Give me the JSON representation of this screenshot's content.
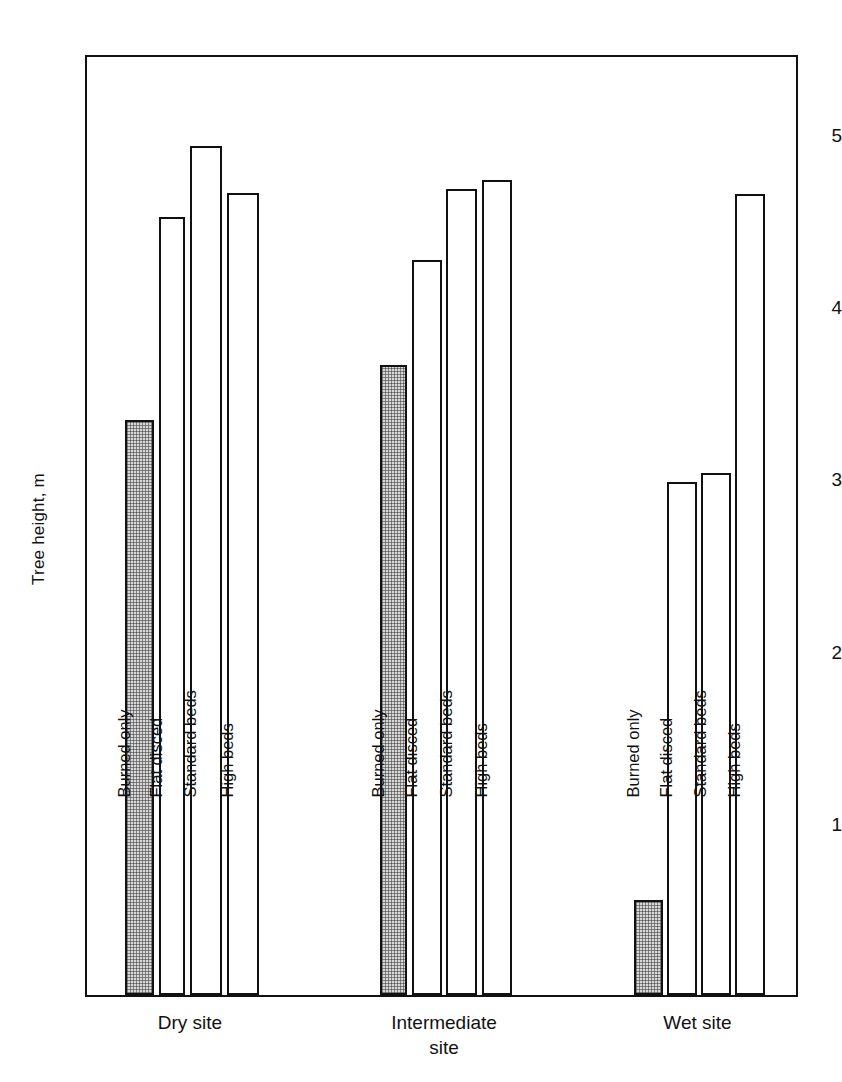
{
  "chart_data": {
    "type": "bar",
    "title": "",
    "subtitle": "",
    "xlabel": "",
    "ylabel": "Tree height, m",
    "ylim": [
      0,
      5.47
    ],
    "grid": false,
    "legend": "none",
    "y_ticks_major": [
      "1",
      "2",
      "3",
      "4",
      "5"
    ],
    "y_ticks_major_values": [
      1,
      2,
      3,
      4,
      5
    ],
    "y_ticks_minor_values": [
      0.5,
      1.5,
      2.5,
      3.5,
      4.5
    ],
    "categories": [
      "Dry site",
      "Intermediate\nsite",
      "Wet site"
    ],
    "treatments": [
      "Burned only",
      "Flat disced",
      "Standard beds",
      "High beds"
    ],
    "groups": [
      {
        "name": "Dry site",
        "bars": [
          {
            "label": "Burned only",
            "value": 3.34,
            "shaded": true
          },
          {
            "label": "Flat disced",
            "value": 4.52,
            "shaded": false
          },
          {
            "label": "Standard beds",
            "value": 4.93,
            "shaded": false
          },
          {
            "label": "High beds",
            "value": 4.66,
            "shaded": false
          }
        ]
      },
      {
        "name": "Intermediate\nsite",
        "bars": [
          {
            "label": "Burned only",
            "value": 3.66,
            "shaded": true
          },
          {
            "label": "Flat disced",
            "value": 4.27,
            "shaded": false
          },
          {
            "label": "Standard beds",
            "value": 4.68,
            "shaded": false
          },
          {
            "label": "High beds",
            "value": 4.73,
            "shaded": false
          }
        ]
      },
      {
        "name": "Wet site",
        "bars": [
          {
            "label": "Burned only",
            "value": 0.55,
            "shaded": true
          },
          {
            "label": "Flat disced",
            "value": 2.98,
            "shaded": false
          },
          {
            "label": "Standard beds",
            "value": 3.03,
            "shaded": false
          },
          {
            "label": "High beds",
            "value": 4.65,
            "shaded": false
          }
        ]
      }
    ],
    "colors": {
      "axis": "#111111",
      "bar_outline": "#111111",
      "bar_fill_open": "#ffffff",
      "bar_fill_shaded": "#d8d8d8",
      "background": "#ffffff"
    }
  },
  "geometry": {
    "plot_left": 85,
    "plot_top": 55,
    "plot_right": 798,
    "plot_bottom": 997,
    "group_x": [
      [
        123,
        152,
        157,
        183,
        188,
        220,
        225,
        257
      ],
      [
        378,
        405,
        410,
        440,
        444,
        475,
        480,
        510
      ],
      [
        632,
        661,
        665,
        695,
        699,
        729,
        733,
        763
      ]
    ]
  }
}
